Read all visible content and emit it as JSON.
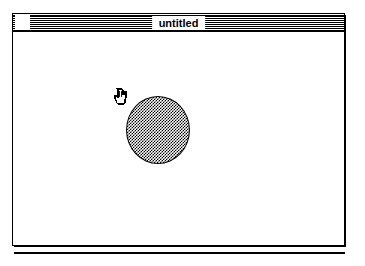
{
  "window": {
    "title": "untitled",
    "close_box_label": "close",
    "titlebar_pattern": "horizontal-stripes",
    "frame_color": "#000000",
    "background_color": "#ffffff"
  },
  "canvas": {
    "background_color": "#ffffff",
    "shapes": [
      {
        "name": "ellipse",
        "type": "ellipse",
        "fill_pattern": "50-percent-dither-checkerboard",
        "fill_color": "#000000",
        "outline_color": "#000000",
        "x": 126,
        "y": 95,
        "width": 64,
        "height": 68
      }
    ]
  },
  "cursor": {
    "type": "hand-grabber",
    "x": 120,
    "y": 88
  },
  "separator": {
    "name": "bottom-rule",
    "color": "#000000"
  }
}
